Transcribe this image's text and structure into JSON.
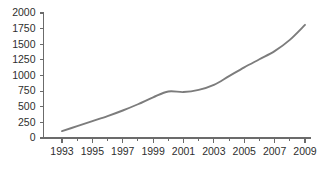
{
  "chart_data": {
    "type": "line",
    "title": "",
    "subtitle": "",
    "xlabel": "",
    "ylabel": "",
    "xlim": [
      1993,
      2009
    ],
    "ylim": [
      0,
      2000
    ],
    "grid": false,
    "legend": false,
    "legend_position": "none",
    "line_color": "#7c7c7c",
    "axis_color": "#6b6b6b",
    "background_color": "#ffffff",
    "x": [
      1993,
      1994,
      1995,
      1996,
      1997,
      1998,
      1999,
      2000,
      2001,
      2002,
      2003,
      2004,
      2005,
      2006,
      2007,
      2008,
      2009
    ],
    "series": [
      {
        "name": "value",
        "values": [
          110,
          190,
          270,
          350,
          440,
          540,
          650,
          745,
          735,
          770,
          850,
          990,
          1130,
          1260,
          1390,
          1570,
          1810
        ]
      }
    ],
    "y_ticks": [
      0,
      250,
      500,
      750,
      1000,
      1250,
      1500,
      1750,
      2000
    ],
    "y_tick_labels": [
      "0",
      "250",
      "500",
      "750",
      "1000",
      "1250",
      "1500",
      "1750",
      "2000"
    ],
    "x_ticks": [
      1993,
      1995,
      1997,
      1999,
      2001,
      2003,
      2005,
      2007,
      2009
    ],
    "x_tick_labels": [
      "1993",
      "1995",
      "1997",
      "1999",
      "2001",
      "2003",
      "2005",
      "2007",
      "2009"
    ],
    "x_minor_ticks": [
      1994,
      1996,
      1998,
      2000,
      2002,
      2004,
      2006,
      2008
    ]
  }
}
